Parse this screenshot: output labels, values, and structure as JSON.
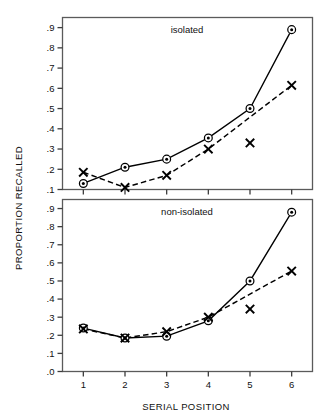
{
  "chart_data": {
    "type": "line",
    "title": "",
    "xlabel": "SERIAL POSITION",
    "ylabel": "PROPORTION RECALLED",
    "x": [
      1,
      2,
      3,
      4,
      5,
      6
    ],
    "xticklabels": [
      "1",
      "2",
      "3",
      "4",
      "5",
      "6"
    ],
    "xlim": [
      0.5,
      6.5
    ],
    "grid": false,
    "legend": "none",
    "panels": [
      {
        "label": "isolated",
        "ylim": [
          0.1,
          0.95
        ],
        "yticks": [
          0.1,
          0.2,
          0.3,
          0.4,
          0.5,
          0.6,
          0.7,
          0.8,
          0.9
        ],
        "yticklabels": [
          ".1",
          ".2",
          ".3",
          ".4",
          ".5",
          ".6",
          ".7",
          ".8",
          ".9"
        ],
        "series": [
          {
            "name": "circle-solid",
            "marker": "circle",
            "linestyle": "solid",
            "values": [
              0.13,
              0.21,
              0.25,
              0.355,
              0.5,
              0.89
            ]
          },
          {
            "name": "x-dashed",
            "marker": "x",
            "linestyle": "dashed",
            "values": [
              0.185,
              0.11,
              0.17,
              0.3,
              null,
              0.615
            ]
          }
        ],
        "extra_points": [
          {
            "name": "unconnected-x",
            "marker": "x",
            "x": 5,
            "y": 0.33
          }
        ]
      },
      {
        "label": "non-isolated",
        "ylim": [
          0.0,
          0.95
        ],
        "yticks": [
          0.0,
          0.1,
          0.2,
          0.3,
          0.4,
          0.5,
          0.6,
          0.7,
          0.8,
          0.9
        ],
        "yticklabels": [
          ".0",
          ".1",
          ".2",
          ".3",
          ".4",
          ".5",
          ".6",
          ".7",
          ".8",
          ".9"
        ],
        "series": [
          {
            "name": "circle-solid",
            "marker": "circle",
            "linestyle": "solid",
            "values": [
              0.24,
              0.185,
              0.195,
              0.28,
              0.5,
              0.88
            ]
          },
          {
            "name": "x-dashed",
            "marker": "x",
            "linestyle": "dashed",
            "values": [
              0.235,
              0.185,
              0.22,
              0.3,
              null,
              0.555
            ]
          }
        ],
        "extra_points": [
          {
            "name": "unconnected-x",
            "marker": "x",
            "x": 5,
            "y": 0.345
          }
        ]
      }
    ],
    "colors": {
      "line": "#000000",
      "axis": "#4a4a4a",
      "text": "#111111",
      "background": "#ffffff"
    }
  }
}
